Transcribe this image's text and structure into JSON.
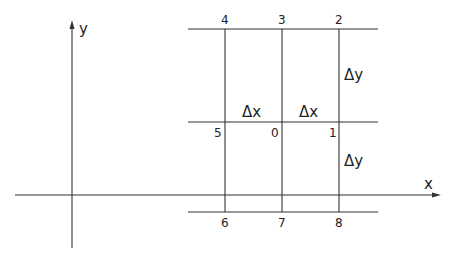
{
  "diagram": {
    "axes": {
      "x_label": "x",
      "y_label": "y"
    },
    "grid_points": {
      "p0": "0",
      "p1": "1",
      "p2": "2",
      "p3": "3",
      "p4": "4",
      "p5": "5",
      "p6": "6",
      "p7": "7",
      "p8": "8"
    },
    "spacing_labels": {
      "dx_left": "Δx",
      "dx_right": "Δx",
      "dy_top": "Δy",
      "dy_bottom": "Δy"
    },
    "colors": {
      "stroke": "#333333",
      "background": "#ffffff"
    }
  }
}
